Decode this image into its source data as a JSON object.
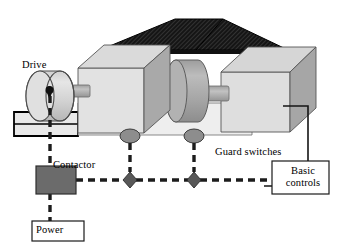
{
  "diagram": {
    "type": "technical-illustration",
    "labels": {
      "drive": "Drive",
      "contactor": "Contactor",
      "guard_switches": "Guard switches",
      "power": "Power",
      "basic_controls": "Basic\ncontrols",
      "basic_controls_line1": "Basic",
      "basic_controls_line2": "controls"
    },
    "colors": {
      "outline": "#000000",
      "box_face_light": "#e4e4e4",
      "box_face_mid": "#c9c9c9",
      "box_face_dark": "#a8a8a8",
      "cylinder_light": "#dcdcdc",
      "cylinder_mid": "#b4b4b4",
      "drum_fill": "#a9a9a9",
      "roof_fill": "#1a1a1a",
      "contactor_fill": "#6a6a6a",
      "switch_fill": "#8a8a8a",
      "node_fill": "#5a5a5a",
      "wire": "#1a1a1a",
      "box_white": "#ffffff",
      "background": "#ffffff"
    },
    "components": [
      {
        "name": "drive-motor",
        "shape": "cylinder",
        "label": "Drive"
      },
      {
        "name": "machine-base",
        "shape": "box",
        "label": ""
      },
      {
        "name": "machine-body-left",
        "shape": "3d-box",
        "label": ""
      },
      {
        "name": "machine-body-right",
        "shape": "3d-box",
        "label": ""
      },
      {
        "name": "guard-roof",
        "shape": "hatched-trapezoid",
        "label": ""
      },
      {
        "name": "drum",
        "shape": "cylinder",
        "label": ""
      },
      {
        "name": "guard-switch-left",
        "shape": "ellipse",
        "label": "Guard switches"
      },
      {
        "name": "guard-switch-right",
        "shape": "ellipse",
        "label": "Guard switches"
      },
      {
        "name": "contactor",
        "shape": "filled-rect",
        "label": "Contactor"
      },
      {
        "name": "power-supply",
        "shape": "outlined-rect",
        "label": "Power"
      },
      {
        "name": "basic-controls",
        "shape": "outlined-rect",
        "label": "Basic controls"
      },
      {
        "name": "circuit-node-left",
        "shape": "diamond",
        "label": ""
      },
      {
        "name": "circuit-node-right",
        "shape": "diamond",
        "label": ""
      }
    ],
    "connections": [
      {
        "from": "power-supply",
        "to": "contactor",
        "style": "dashed-thick"
      },
      {
        "from": "contactor",
        "to": "drive-motor",
        "style": "dashed-thick"
      },
      {
        "from": "contactor",
        "to": "circuit-node-left",
        "style": "dashed-thick"
      },
      {
        "from": "circuit-node-left",
        "to": "circuit-node-right",
        "style": "dashed-thick"
      },
      {
        "from": "circuit-node-right",
        "to": "basic-controls",
        "style": "dashed-thick"
      },
      {
        "from": "guard-switch-left",
        "to": "circuit-node-left",
        "style": "dashed-thick"
      },
      {
        "from": "guard-switch-right",
        "to": "circuit-node-right",
        "style": "dashed-thick"
      },
      {
        "from": "machine-body-right",
        "to": "basic-controls",
        "style": "solid"
      }
    ]
  }
}
